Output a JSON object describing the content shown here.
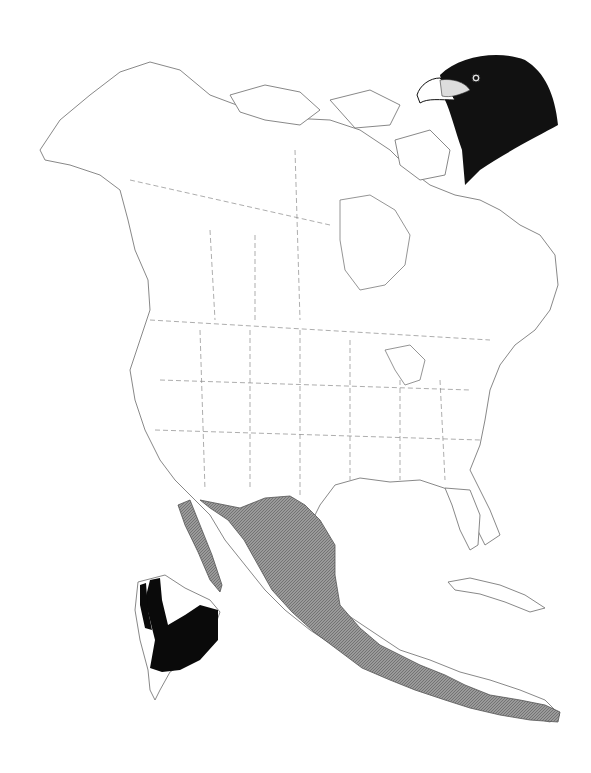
{
  "map": {
    "subject": "range map",
    "region": "North America",
    "inset": "South America",
    "illustration": "falcon-head",
    "colors": {
      "background": "#ffffff",
      "outline": "#7a7a7a",
      "range_fill": "#8c8c8c",
      "resident_fill": "#0a0a0a"
    },
    "legend_items": []
  }
}
